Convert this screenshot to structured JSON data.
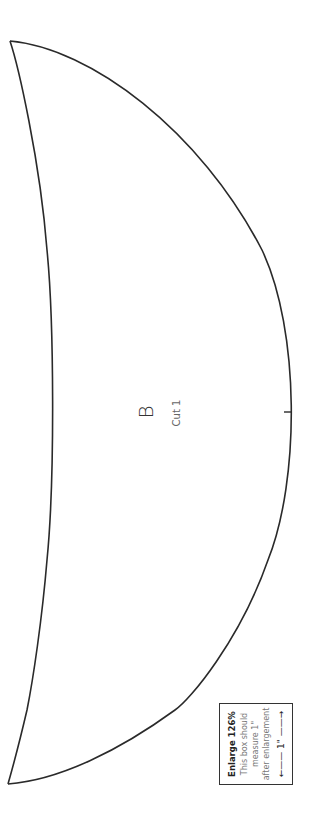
{
  "pattern_piece": {
    "letter": "B",
    "instruction": "Cut 1",
    "stroke_color": "#2a2a2a",
    "outline": {
      "top_point": [
        10,
        41
      ],
      "bottom_point": [
        8,
        784
      ],
      "outer_curve_apex": [
        291,
        412
      ],
      "inner_curve_apex": [
        53,
        410
      ]
    },
    "notch": {
      "x1": 284,
      "x2": 291,
      "y": 412
    }
  },
  "scale_box": {
    "title": "Enlarge 126%",
    "line1": "This box should",
    "line2": "measure 1\"",
    "line3": "after enlargement",
    "measure": "←—— 1\" ——→",
    "border_color": "#333333"
  }
}
